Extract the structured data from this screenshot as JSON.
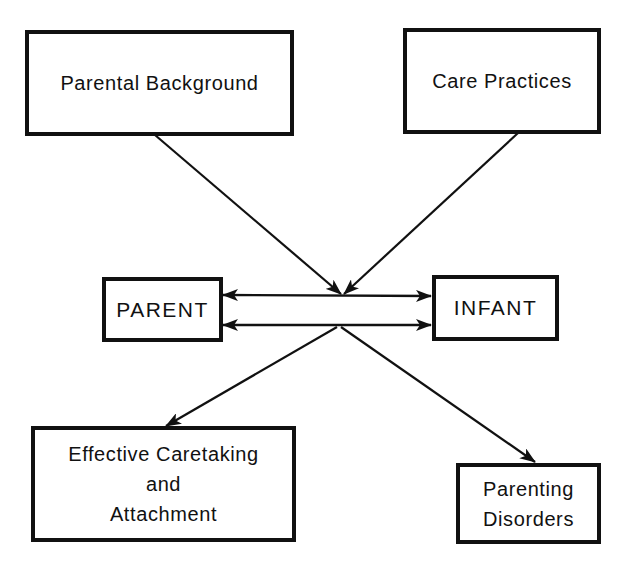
{
  "diagram": {
    "nodes": {
      "parental_background": {
        "label": "Parental Background"
      },
      "care_practices": {
        "label": "Care Practices"
      },
      "parent": {
        "label": "PARENT"
      },
      "infant": {
        "label": "INFANT"
      },
      "effective_caretaking": {
        "lines": [
          "Effective Caretaking",
          "and",
          "Attachment"
        ]
      },
      "parenting_disorders": {
        "lines": [
          "Parenting",
          "Disorders"
        ]
      }
    },
    "edges": [
      {
        "from": "parental_background",
        "to": "parent-infant interaction",
        "type": "arrow"
      },
      {
        "from": "care_practices",
        "to": "parent-infant interaction",
        "type": "arrow"
      },
      {
        "from": "parent",
        "to": "infant",
        "type": "bidirectional"
      },
      {
        "from": "infant",
        "to": "parent",
        "type": "bidirectional"
      },
      {
        "from": "parent-infant interaction",
        "to": "effective_caretaking",
        "type": "arrow"
      },
      {
        "from": "parent-infant interaction",
        "to": "parenting_disorders",
        "type": "arrow"
      }
    ],
    "colors": {
      "stroke": "#111111",
      "background": "#ffffff"
    }
  }
}
